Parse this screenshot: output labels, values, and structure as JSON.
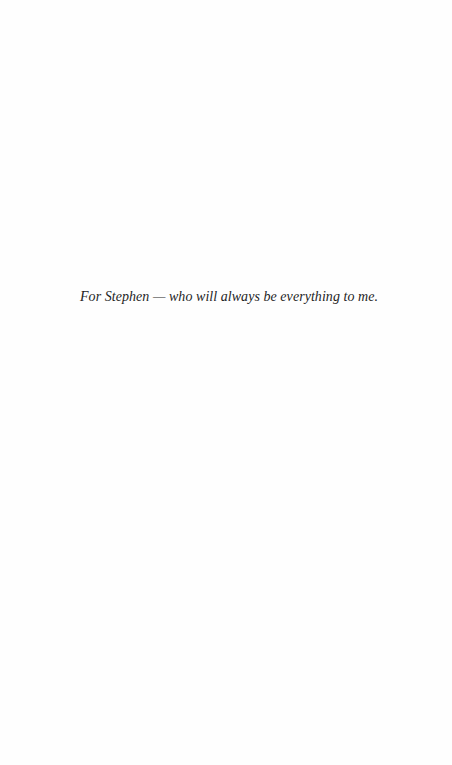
{
  "page": {
    "background": "#fefefe",
    "text_color": "#1f1f1f"
  },
  "dedication": {
    "text": "For Stephen — who will always be everything to me."
  }
}
